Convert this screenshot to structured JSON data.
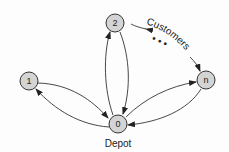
{
  "diagram": {
    "type": "vehicle-routing-graph",
    "colors": {
      "node_fill": "#d4d4d4",
      "stroke": "#333333",
      "background": "#fdfdfd"
    },
    "nodes": [
      {
        "id": "0",
        "label": "0",
        "x": 118,
        "y": 124,
        "role": "depot"
      },
      {
        "id": "1",
        "label": "1",
        "x": 29,
        "y": 81,
        "role": "customer"
      },
      {
        "id": "2",
        "label": "2",
        "x": 115,
        "y": 23,
        "role": "customer"
      },
      {
        "id": "n",
        "label": "n",
        "x": 206,
        "y": 80,
        "role": "customer"
      }
    ],
    "edges": [
      {
        "from": "1",
        "to": "0"
      },
      {
        "from": "0",
        "to": "1"
      },
      {
        "from": "0",
        "to": "2"
      },
      {
        "from": "2",
        "to": "0"
      },
      {
        "from": "0",
        "to": "n"
      },
      {
        "from": "n",
        "to": "0"
      }
    ],
    "labels": {
      "depot": "Depot",
      "customers": "Customers",
      "ellipsis": "• • •"
    }
  }
}
